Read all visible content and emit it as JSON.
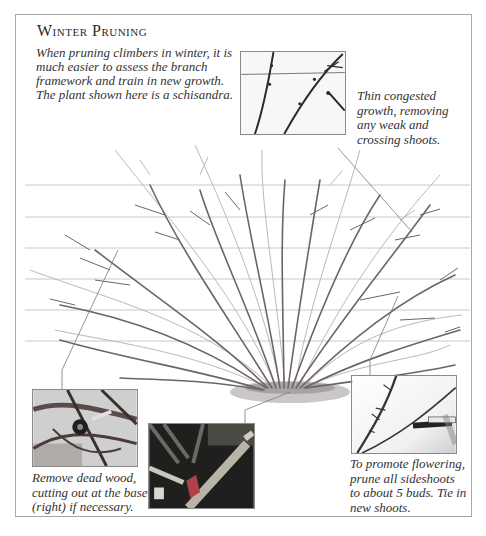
{
  "page": {
    "title": "Winter Pruning",
    "intro": "When pruning climbers in winter, it is much easier to assess the branch framework and train in new growth. The plant shown here is a schisandra."
  },
  "illustration": {
    "subject": "schisandra climber on horizontal support wires",
    "wire_count": 6
  },
  "callouts": [
    {
      "id": "thin-growth",
      "photo": "close-up of congested stems on wire",
      "caption": "Thin congested growth, removing any weak and crossing shoots."
    },
    {
      "id": "dead-wood",
      "photo": "secateurs cutting tangled dead wood",
      "caption": "Remove dead wood, cutting out at the base (right) if necessary."
    },
    {
      "id": "base-cut",
      "photo": "pruning saw cutting stem at base",
      "caption": ""
    },
    {
      "id": "sideshoots",
      "photo": "secateurs cutting sideshoot to buds",
      "caption": "To promote flowering, prune all sideshoots to about 5 buds. Tie in new shoots."
    }
  ],
  "colors": {
    "frame": "#a8a8a8",
    "wire": "#c4c4c4",
    "stem_dark": "#6e6468",
    "stem_light": "#b9b3b6",
    "text": "#333333"
  }
}
